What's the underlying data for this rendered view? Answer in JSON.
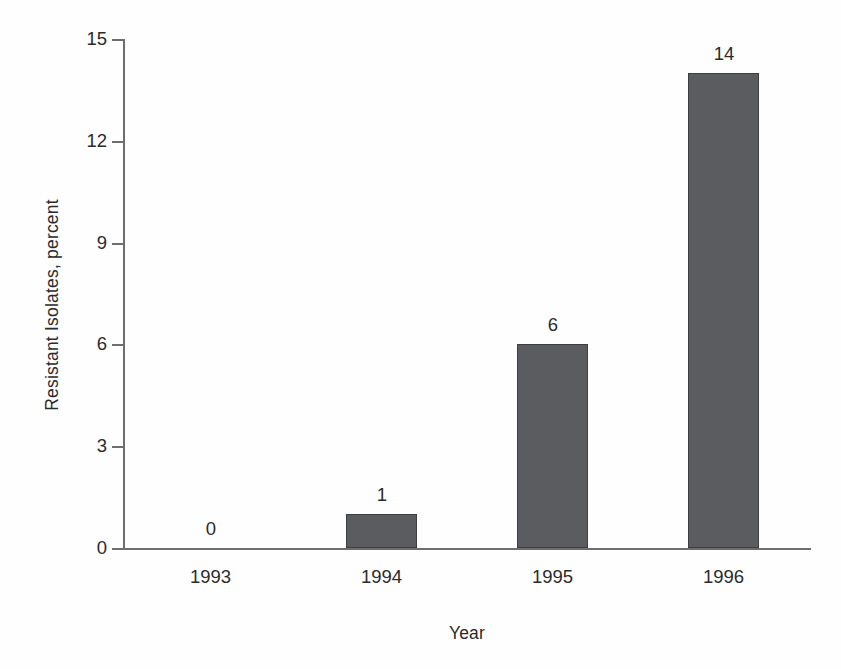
{
  "chart_data": {
    "type": "bar",
    "title": "",
    "subtitle": "",
    "xlabel": "Year",
    "ylabel": "Resistant Isolates, percent",
    "categories": [
      "1993",
      "1994",
      "1995",
      "1996"
    ],
    "values": [
      0,
      1,
      6,
      14
    ],
    "data_labels": [
      "0",
      "1",
      "6",
      "14"
    ],
    "ylim": [
      0,
      15
    ],
    "yticks": [
      0,
      3,
      6,
      9,
      12,
      15
    ],
    "ytick_labels": [
      "0",
      "3",
      "6",
      "9",
      "12",
      "15"
    ],
    "xticks_visible": false,
    "grid": false,
    "legend": null,
    "annotations": [],
    "series": [
      {
        "name": "Resistant Isolates, percent",
        "values": [
          0,
          1,
          6,
          14
        ],
        "color": "#5a5c60",
        "edge_color": "#3c3e42"
      }
    ],
    "colors": {
      "bar_fill": "#5a5c60",
      "bar_edge": "#3c3e42",
      "axis": "#6e6e6e",
      "text": "#2b2b2b",
      "background": "#fefefe"
    }
  }
}
